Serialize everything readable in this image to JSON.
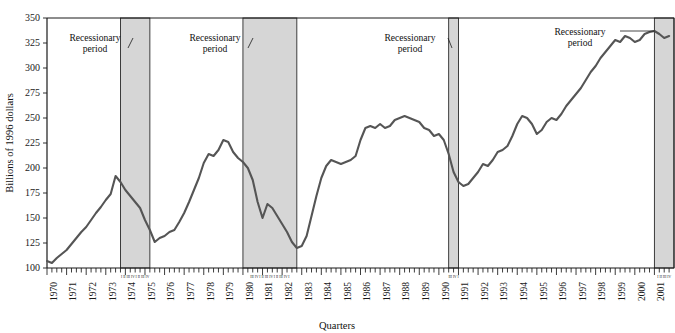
{
  "chart_data": {
    "type": "line",
    "title": "",
    "xlabel": "Quarters",
    "ylabel": "Billions of 1996 dollars",
    "ylim": [
      100,
      350
    ],
    "yticks": [
      100,
      125,
      150,
      175,
      200,
      225,
      250,
      275,
      300,
      325,
      350
    ],
    "grid": false,
    "legend": "none",
    "series_name": "Real investment",
    "line_color": "#555555",
    "band_color": "#d6d6d6",
    "band_border": "#2b2b2b",
    "axis_color": "#1a1a1a",
    "x_start_year": 1970,
    "x_end_year": 2001,
    "x_tick_labels": [
      "1970",
      "1971",
      "1972",
      "1973",
      "1974",
      "1975",
      "1976",
      "1977",
      "1978",
      "1979",
      "1980",
      "1981",
      "1982",
      "1983",
      "1984",
      "1985",
      "1986",
      "1987",
      "1988",
      "1989",
      "1990",
      "1991",
      "1992",
      "1993",
      "1994",
      "1995",
      "1996",
      "1997",
      "1998",
      "1999",
      "2000",
      "2001"
    ],
    "quarter_marks": [
      "I",
      "II",
      "III",
      "IV"
    ],
    "annotations": [
      {
        "text_line1": "Recessionary",
        "text_line2": "period",
        "target_band": 0
      },
      {
        "text_line1": "Recessionary",
        "text_line2": "period",
        "target_band": 1
      },
      {
        "text_line1": "Recessionary",
        "text_line2": "period",
        "target_band": 2
      },
      {
        "text_line1": "Recessionary",
        "text_line2": "period",
        "target_band": 3
      }
    ],
    "recession_bands": [
      {
        "start_year": 1973.75,
        "end_year": 1975.25,
        "label_quarters": "I II III IV I II III IV"
      },
      {
        "start_year": 1980.0,
        "end_year": 1982.75,
        "label_quarters": "III IV I II III IV I II III IV I"
      },
      {
        "start_year": 1990.5,
        "end_year": 1991.0,
        "label_quarters": "III IV I"
      },
      {
        "start_year": 2001.0,
        "end_year": 2002.0,
        "label_quarters": "I II III IV"
      }
    ],
    "values": [
      107.0,
      105.0,
      110.0,
      114.0,
      118.0,
      124.0,
      130.0,
      136.0,
      141.0,
      148.0,
      155.0,
      161.0,
      168.0,
      174.0,
      192.0,
      186.0,
      178.0,
      172.0,
      166.0,
      160.0,
      148.0,
      138.0,
      126.0,
      130.0,
      132.0,
      136.0,
      138.0,
      146.0,
      155.0,
      166.0,
      178.0,
      190.0,
      205.0,
      214.0,
      212.0,
      218.0,
      228.0,
      226.0,
      216.0,
      210.0,
      206.0,
      200.0,
      188.0,
      166.0,
      150.0,
      164.0,
      160.0,
      152.0,
      144.0,
      136.0,
      126.0,
      120.0,
      122.0,
      132.0,
      152.0,
      172.0,
      190.0,
      202.0,
      208.0,
      206.0,
      204.0,
      206.0,
      208.0,
      212.0,
      228.0,
      240.0,
      242.0,
      240.0,
      244.0,
      240.0,
      242.0,
      248.0,
      250.0,
      252.0,
      250.0,
      248.0,
      246.0,
      240.0,
      238.0,
      232.0,
      234.0,
      228.0,
      214.0,
      196.0,
      186.0,
      182.0,
      184.0,
      190.0,
      196.0,
      204.0,
      202.0,
      208.0,
      216.0,
      218.0,
      222.0,
      232.0,
      244.0,
      252.0,
      250.0,
      244.0,
      234.0,
      238.0,
      246.0,
      250.0,
      248.0,
      254.0,
      262.0,
      268.0,
      274.0,
      280.0,
      288.0,
      296.0,
      302.0,
      310.0,
      316.0,
      322.0,
      328.0,
      326.0,
      332.0,
      330.0,
      326.0,
      328.0,
      334.0,
      336.0,
      337.0,
      334.0,
      330.0,
      332.0
    ]
  }
}
